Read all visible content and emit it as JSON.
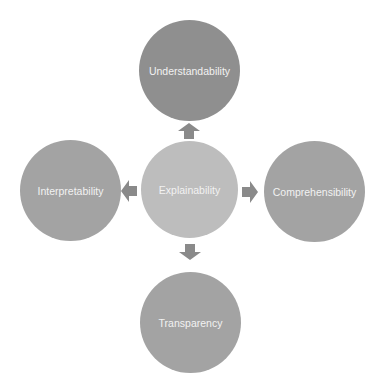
{
  "diagram": {
    "center": {
      "label": "Explainability",
      "color": "#bdbdbd"
    },
    "nodes": [
      {
        "id": "top",
        "label": "Understandability",
        "color": "#8f8f8f"
      },
      {
        "id": "left",
        "label": "Interpretability",
        "color": "#a3a3a3"
      },
      {
        "id": "right",
        "label": "Comprehensibility",
        "color": "#a3a3a3"
      },
      {
        "id": "bottom",
        "label": "Transparency",
        "color": "#a3a3a3"
      }
    ],
    "arrow_color": "#8a8a8a",
    "edges": [
      {
        "from": "Explainability",
        "to": "Understandability",
        "direction": "up"
      },
      {
        "from": "Explainability",
        "to": "Interpretability",
        "direction": "left"
      },
      {
        "from": "Explainability",
        "to": "Comprehensibility",
        "direction": "right"
      },
      {
        "from": "Explainability",
        "to": "Transparency",
        "direction": "down"
      }
    ]
  }
}
